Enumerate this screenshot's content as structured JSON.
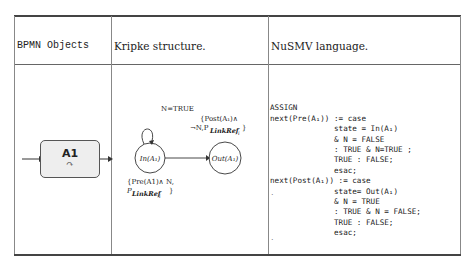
{
  "table": {
    "headers": [
      "BPMN Objects",
      "Kripke structure.",
      "NuSMV language."
    ]
  },
  "bpmn": {
    "task_label": "A1",
    "loop_icon": "loop-icon"
  },
  "kripke": {
    "states": [
      "In(A₁)",
      "Out(A₁)"
    ],
    "self_loop_label": "N=TRUE",
    "transition_label_line1": "{Post(A₁)∧",
    "transition_label_line2": "¬N,P",
    "transition_label_sub": "LinkRef",
    "transition_label_subsub": "i",
    "in_label_line1": "{Pre(A1)∧ N,",
    "in_label_line2": "P",
    "in_label_sub": "LinkRef",
    "in_label_subsub": "i",
    "close_brace": "}"
  },
  "nusmv": {
    "lines": [
      "ASSIGN",
      "next(Pre(A₁)) := case",
      "              state = In(A₁)",
      "              & N = FALSE",
      "              : TRUE & N=TRUE ;",
      "              TRUE : FALSE;",
      "              esac;",
      "next(Post(A₁)) := case",
      "              state= Out(A₁)",
      "              & N = TRUE",
      "              : TRUE & N = FALSE;",
      "              TRUE : FALSE;",
      "              esac;"
    ]
  }
}
